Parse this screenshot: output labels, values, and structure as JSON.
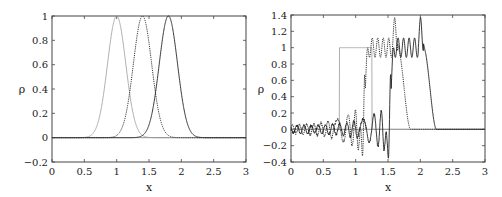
{
  "chart_data": [
    {
      "type": "line",
      "title": "",
      "xlabel": "x",
      "ylabel": "ρ",
      "xlim": [
        0,
        3
      ],
      "ylim": [
        -0.2,
        1
      ],
      "xticks": [
        "0",
        "0.5",
        "1",
        "1.5",
        "2",
        "2.5",
        "3"
      ],
      "yticks": [
        "-0.2",
        "0",
        "0.2",
        "0.4",
        "0.6",
        "0.8",
        "1"
      ],
      "grid": false,
      "legend": null,
      "series": [
        {
          "name": "pulse at t0 (light)",
          "style": "solid-light",
          "shape": "gaussian",
          "center": 1.0,
          "peak": 1.0,
          "halfwidth": 0.2
        },
        {
          "name": "pulse at t1 (dotted)",
          "style": "dotted",
          "shape": "gaussian",
          "center": 1.4,
          "peak": 1.0,
          "halfwidth": 0.2
        },
        {
          "name": "pulse at t2 (solid)",
          "style": "solid",
          "shape": "gaussian",
          "center": 1.8,
          "peak": 1.0,
          "halfwidth": 0.2
        }
      ]
    },
    {
      "type": "line",
      "title": "",
      "xlabel": "x",
      "ylabel": "ρ",
      "xlim": [
        0,
        3
      ],
      "ylim": [
        -0.4,
        1.4
      ],
      "xticks": [
        "0",
        "0.5",
        "1",
        "1.5",
        "2",
        "2.5",
        "3"
      ],
      "yticks": [
        "-0.4",
        "-0.2",
        "0",
        "0.2",
        "0.4",
        "0.6",
        "0.8",
        "1",
        "1.2",
        "1.4"
      ],
      "grid": false,
      "legend": null,
      "series": [
        {
          "name": "square pulse initial (light)",
          "style": "solid-light",
          "shape": "step",
          "x_start": 0.75,
          "x_end": 1.25,
          "value": 1.0
        },
        {
          "name": "square pulse t1 (dotted)",
          "style": "dotted",
          "shape": "oscillating-step",
          "x_start": 1.15,
          "x_end": 1.65,
          "plateau": 1.0,
          "overshoot_peak": 1.28,
          "min_undershoot": -0.28
        },
        {
          "name": "square pulse t2 (solid)",
          "style": "solid",
          "shape": "oscillating-step",
          "x_start": 1.55,
          "x_end": 2.05,
          "plateau": 1.0,
          "overshoot_peak": 1.28,
          "min_undershoot": -0.35
        }
      ]
    }
  ],
  "panels": [
    {
      "ylabel": "ρ",
      "xlabel": "x",
      "xticks": [
        "0",
        "0.5",
        "1",
        "1.5",
        "2",
        "2.5",
        "3"
      ],
      "yticks": [
        "−0.2",
        "0",
        "0.2",
        "0.4",
        "0.6",
        "0.8",
        "1"
      ]
    },
    {
      "ylabel": "ρ",
      "xlabel": "x",
      "xticks": [
        "0",
        "0.5",
        "1",
        "1.5",
        "2",
        "2.5",
        "3"
      ],
      "yticks": [
        "−0.4",
        "−0.2",
        "0",
        "0.2",
        "0.4",
        "0.6",
        "0.8",
        "1",
        "1.2",
        "1.4"
      ]
    }
  ]
}
